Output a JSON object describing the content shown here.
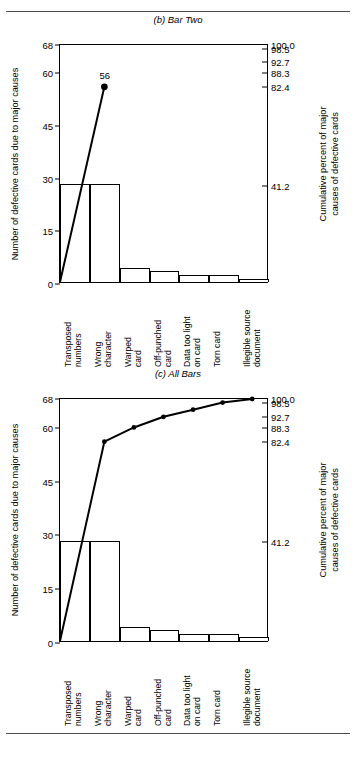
{
  "page": {
    "clipped_header_text": ""
  },
  "charts": [
    {
      "id": "bar-two",
      "title": "(b) Bar Two",
      "point_label": "56"
    },
    {
      "id": "all-bars",
      "title": "(c) All Bars",
      "point_label": ""
    }
  ],
  "axes": {
    "left_title": "Number of defective cards due to major causes",
    "right_title_line1": "Cumulative percent of major",
    "right_title_line2": "causes of defective cards",
    "left_ticks": [
      "0",
      "15",
      "30",
      "45",
      "60",
      "68"
    ],
    "right_ticks": [
      "41.2",
      "82.4",
      "88.3",
      "92.7",
      "98.5",
      "100.0"
    ]
  },
  "categories": [
    {
      "line1": "Transposed",
      "line2": "numbers"
    },
    {
      "line1": "Wrong",
      "line2": "character"
    },
    {
      "line1": "Warped",
      "line2": "card"
    },
    {
      "line1": "Off-punched",
      "line2": "card"
    },
    {
      "line1": "Data too light",
      "line2": "on card"
    },
    {
      "line1": "Torn card",
      "line2": ""
    },
    {
      "line1": "Illegible source",
      "line2": "document"
    }
  ],
  "chart_data": [
    {
      "type": "bar",
      "id": "bar-two",
      "title": "(b) Bar Two",
      "categories": [
        "Transposed numbers",
        "Wrong character",
        "Warped card",
        "Off-punched card",
        "Data too light on card",
        "Torn card",
        "Illegible source document"
      ],
      "values": [
        28,
        28,
        4,
        3,
        2,
        2,
        1
      ],
      "xlabel": "",
      "ylabel": "Number of defective cards due to major causes",
      "ylim": [
        0,
        68
      ],
      "yticks": [
        0,
        15,
        30,
        45,
        60,
        68
      ],
      "y2label": "Cumulative percent of major causes of defective cards",
      "y2lim": [
        0,
        100.0
      ],
      "y2ticks": [
        41.2,
        82.4,
        88.3,
        92.7,
        98.5,
        100.0
      ],
      "grid": false,
      "legend": "none",
      "series": [
        {
          "name": "Cumulative count (partial)",
          "type": "line",
          "x": [
            0,
            1
          ],
          "values": [
            0,
            56
          ],
          "annotations": [
            {
              "x": 1,
              "y": 56,
              "text": "56"
            }
          ]
        }
      ]
    },
    {
      "type": "bar",
      "id": "all-bars",
      "title": "(c) All Bars",
      "categories": [
        "Transposed numbers",
        "Wrong character",
        "Warped card",
        "Off-punched card",
        "Data too light on card",
        "Torn card",
        "Illegible source document"
      ],
      "values": [
        28,
        28,
        4,
        3,
        2,
        2,
        1
      ],
      "xlabel": "",
      "ylabel": "Number of defective cards due to major causes",
      "ylim": [
        0,
        68
      ],
      "yticks": [
        0,
        15,
        30,
        45,
        60,
        68
      ],
      "y2label": "Cumulative percent of major causes of defective cards",
      "y2lim": [
        0,
        100.0
      ],
      "y2ticks": [
        41.2,
        82.4,
        88.3,
        92.7,
        98.5,
        100.0
      ],
      "grid": false,
      "legend": "none",
      "series": [
        {
          "name": "Cumulative count",
          "type": "line",
          "x": [
            0,
            1,
            2,
            3,
            4,
            5,
            6
          ],
          "values": [
            0,
            56,
            60,
            63,
            65,
            67,
            68
          ],
          "cumulative_percent": [
            0,
            82.4,
            88.3,
            92.7,
            95.6,
            98.5,
            100.0
          ]
        }
      ]
    }
  ]
}
